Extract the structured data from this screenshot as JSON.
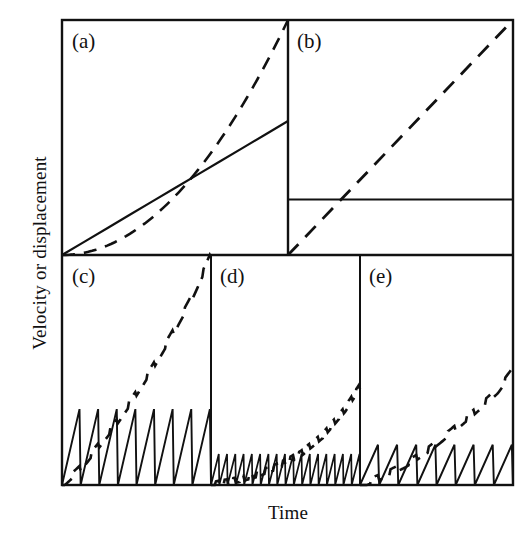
{
  "figure": {
    "title": "",
    "y_axis_label": "Velocity or displacement",
    "x_axis_label": "Time",
    "panel_labels": [
      "(a)",
      "(b)",
      "(c)",
      "(d)",
      "(e)"
    ],
    "line_color": "#000000",
    "background_color": "#ffffff",
    "solid_legend_meaning": "Velocity",
    "dashed_legend_meaning": "Displacement"
  },
  "chart_data": {
    "type": "line",
    "title": "",
    "xlabel": "Time",
    "ylabel": "Velocity or displacement",
    "xlim": [
      0,
      1
    ],
    "ylim": [
      0,
      1
    ],
    "grid": false,
    "legend_position": "none",
    "panels": [
      {
        "label": "(a)",
        "description": "Smooth accelerating sliding: velocity increases linearly, displacement grows parabolically",
        "series": [
          {
            "name": "velocity",
            "style": "solid",
            "x": [
              0,
              0.1,
              0.2,
              0.3,
              0.4,
              0.5,
              0.6,
              0.7,
              0.8,
              0.9,
              1.0
            ],
            "y": [
              0.0,
              0.057,
              0.114,
              0.171,
              0.228,
              0.285,
              0.342,
              0.399,
              0.456,
              0.513,
              0.57
            ]
          },
          {
            "name": "displacement",
            "style": "dashed",
            "x": [
              0,
              0.1,
              0.2,
              0.3,
              0.4,
              0.5,
              0.6,
              0.7,
              0.8,
              0.9,
              1.0
            ],
            "y": [
              0.0,
              0.01,
              0.04,
              0.09,
              0.16,
              0.25,
              0.36,
              0.49,
              0.64,
              0.81,
              1.0
            ]
          }
        ]
      },
      {
        "label": "(b)",
        "description": "Steady sliding: constant velocity, displacement grows linearly",
        "series": [
          {
            "name": "velocity",
            "style": "solid",
            "x": [
              0,
              1.0
            ],
            "y": [
              0.236,
              0.236
            ]
          },
          {
            "name": "displacement",
            "style": "dashed",
            "x": [
              0,
              1.0
            ],
            "y": [
              0.0,
              1.0
            ]
          }
        ]
      },
      {
        "label": "(c)",
        "description": "Stick-slip: large-amplitude, low-frequency sawtooth velocity; staircase displacement rising steeply",
        "sawtooth": {
          "cycles": 8,
          "amplitude": 0.33,
          "baseline": 0.0
        },
        "series": [
          {
            "name": "velocity",
            "style": "solid-sawtooth",
            "cycles": 8,
            "peak": 0.33
          },
          {
            "name": "displacement",
            "style": "dashed-staircase",
            "x": [
              0,
              0.125,
              0.25,
              0.375,
              0.5,
              0.625,
              0.75,
              0.875,
              1.0
            ],
            "y": [
              0.0,
              0.075,
              0.175,
              0.28,
              0.4,
              0.53,
              0.67,
              0.82,
              1.0
            ]
          }
        ]
      },
      {
        "label": "(d)",
        "description": "Stick-slip: small-amplitude, high-frequency sawtooth velocity; shallow staircase displacement",
        "sawtooth": {
          "cycles": 18,
          "amplitude": 0.135,
          "baseline": 0.0
        },
        "series": [
          {
            "name": "velocity",
            "style": "solid-sawtooth",
            "cycles": 18,
            "peak": 0.135
          },
          {
            "name": "displacement",
            "style": "dashed-staircase",
            "x": [
              0,
              0.15,
              0.3,
              0.45,
              0.6,
              0.75,
              0.9,
              1.0
            ],
            "y": [
              0.0,
              0.018,
              0.045,
              0.082,
              0.135,
              0.215,
              0.33,
              0.43
            ]
          }
        ]
      },
      {
        "label": "(e)",
        "description": "Stick-slip: intermediate-amplitude, intermediate-frequency sawtooth velocity; moderate staircase displacement",
        "sawtooth": {
          "cycles": 8,
          "amplitude": 0.175,
          "baseline": 0.0
        },
        "series": [
          {
            "name": "velocity",
            "style": "solid-sawtooth",
            "cycles": 8,
            "peak": 0.175
          },
          {
            "name": "displacement",
            "style": "dashed-staircase",
            "x": [
              0,
              0.15,
              0.3,
              0.45,
              0.6,
              0.75,
              0.9,
              1.0
            ],
            "y": [
              0.0,
              0.04,
              0.09,
              0.155,
              0.235,
              0.32,
              0.41,
              0.5
            ]
          }
        ]
      }
    ]
  }
}
